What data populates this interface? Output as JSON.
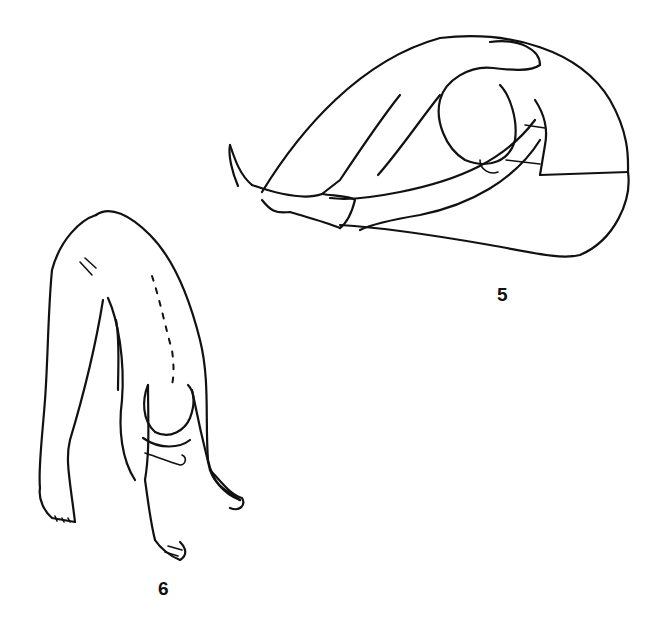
{
  "figures": [
    {
      "id": "5",
      "label": "5",
      "description": "Seated forward bend: person sitting with legs extended, head down toward knees, hands holding feet"
    },
    {
      "id": "6",
      "label": "6",
      "description": "Standing forward bend: person bent at the hips with hands and feet on the floor"
    }
  ],
  "colors": {
    "ink": "#111111",
    "background": "#ffffff"
  }
}
